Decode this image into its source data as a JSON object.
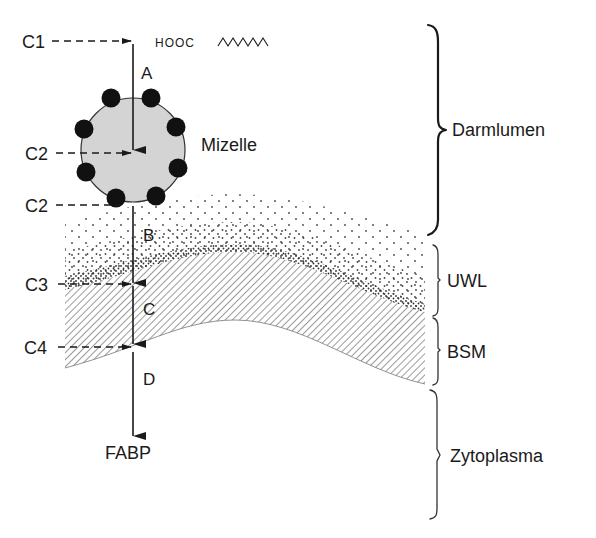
{
  "diagram": {
    "molecule": {
      "label": "HOOC",
      "tail": "zigzag"
    },
    "micelle": {
      "label": "Mizelle",
      "fill": "#d4d4d4",
      "dot_color": "#111111"
    },
    "concentrations": [
      {
        "id": "c1",
        "label": "C1"
      },
      {
        "id": "c2a",
        "label": "C2"
      },
      {
        "id": "c2b",
        "label": "C2"
      },
      {
        "id": "c3",
        "label": "C3"
      },
      {
        "id": "c4",
        "label": "C4"
      }
    ],
    "steps": [
      {
        "id": "a",
        "label": "A"
      },
      {
        "id": "b",
        "label": "B"
      },
      {
        "id": "c",
        "label": "C"
      },
      {
        "id": "d",
        "label": "D"
      }
    ],
    "endpoint": {
      "label": "FABP"
    },
    "regions": [
      {
        "id": "lumen",
        "label": "Darmlumen"
      },
      {
        "id": "uwl",
        "label": "UWL"
      },
      {
        "id": "bsm",
        "label": "BSM"
      },
      {
        "id": "cytoplasm",
        "label": "Zytoplasma"
      }
    ],
    "colors": {
      "ink": "#1a1a1a",
      "micelle_fill": "#d4d4d4",
      "hatch": "#555555",
      "stipple": "#444444"
    }
  }
}
